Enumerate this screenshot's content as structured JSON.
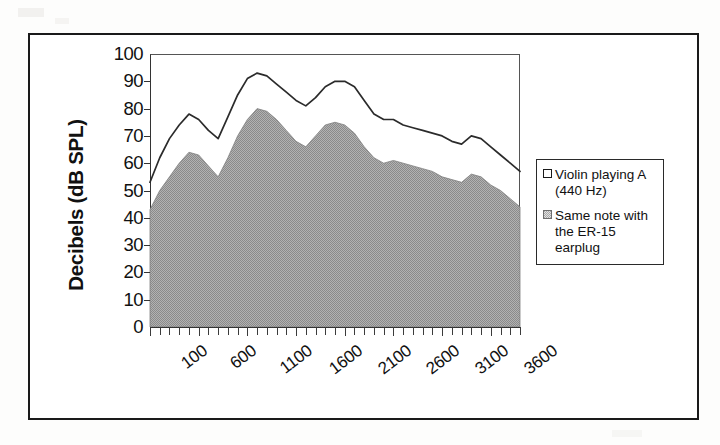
{
  "figure": {
    "y_axis_title": "Decibels (dB SPL)"
  },
  "legend": {
    "items": [
      {
        "label": "Violin playing A (440 Hz)",
        "swatch": "outline-square-icon"
      },
      {
        "label": "Same note with the ER-15 earplug",
        "swatch": "dotted-square-icon"
      }
    ]
  },
  "chart_data": {
    "type": "area",
    "title": "",
    "xlabel": "",
    "ylabel": "Decibels (dB SPL)",
    "xlim": [
      100,
      3900
    ],
    "ylim": [
      0,
      100
    ],
    "ytick_step": 10,
    "yticks": [
      0,
      10,
      20,
      30,
      40,
      50,
      60,
      70,
      80,
      90,
      100
    ],
    "xticks_labeled": [
      100,
      600,
      1100,
      1600,
      2100,
      2600,
      3100,
      3600
    ],
    "xtick_step_hz": 100,
    "grid": false,
    "legend_position": "right",
    "x": [
      100,
      200,
      300,
      400,
      500,
      600,
      700,
      800,
      900,
      1000,
      1100,
      1200,
      1300,
      1400,
      1500,
      1600,
      1700,
      1800,
      1900,
      2000,
      2100,
      2200,
      2300,
      2400,
      2500,
      2600,
      2700,
      2800,
      2900,
      3000,
      3100,
      3200,
      3300,
      3400,
      3500,
      3600,
      3700,
      3800,
      3900
    ],
    "series": [
      {
        "name": "Violin playing A (440 Hz)",
        "style": "line",
        "color": "#2b2b2b",
        "values": [
          53,
          62,
          69,
          74,
          78,
          76,
          72,
          69,
          77,
          85,
          91,
          93,
          92,
          89,
          86,
          83,
          81,
          84,
          88,
          90,
          90,
          88,
          83,
          78,
          76,
          76,
          74,
          73,
          72,
          71,
          70,
          68,
          67,
          70,
          69,
          66,
          63,
          60,
          57
        ]
      },
      {
        "name": "Same note with the ER-15 earplug",
        "style": "area",
        "color": "#a8a8a8",
        "values": [
          43,
          50,
          55,
          60,
          64,
          63,
          59,
          55,
          62,
          70,
          76,
          80,
          79,
          76,
          72,
          68,
          66,
          70,
          74,
          75,
          74,
          71,
          66,
          62,
          60,
          61,
          60,
          59,
          58,
          57,
          55,
          54,
          53,
          56,
          55,
          52,
          50,
          47,
          44
        ]
      }
    ]
  }
}
